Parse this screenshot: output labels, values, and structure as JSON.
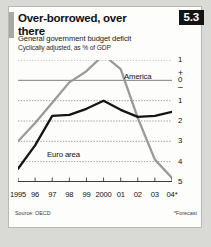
{
  "header": {
    "title": "Over-borrowed, over there",
    "badge": "5.3",
    "subtitle1": "General government budget deficit",
    "subtitle2": "Cyclically adjusted, as % of GDP"
  },
  "footer": {
    "source": "Source: OECD",
    "forecast_note": "*Forecast"
  },
  "labels": {
    "america": "America",
    "euro": "Euro area"
  },
  "colors": {
    "america": "#9a9a98",
    "euro": "#151515",
    "grid": "#8d8d8a",
    "zero_line": "#6f6f6d",
    "badge_bg": "#141414",
    "accent_bar": "#a9a9a4",
    "card_bg": "#fdfdfb",
    "page_bg": "#d9d9d5"
  },
  "chart_data": {
    "type": "line",
    "title": "Over-borrowed, over there",
    "subtitle": "General government budget deficit",
    "units": "Cyclically adjusted, as % of GDP",
    "xlabel": "",
    "ylabel": "% of GDP",
    "x": [
      1995,
      1996,
      1997,
      1998,
      1999,
      2000,
      2001,
      2002,
      2003,
      2004
    ],
    "xticklabels": [
      "1995",
      "96",
      "97",
      "98",
      "99",
      "2000",
      "01",
      "02",
      "03",
      "04*"
    ],
    "ylim": [
      -5,
      1
    ],
    "yticks": [
      1,
      0,
      -1,
      -2,
      -3,
      -4,
      -5
    ],
    "yticklabels": [
      "1",
      "0",
      "1",
      "2",
      "3",
      "4",
      "5"
    ],
    "ysign_plus": "+",
    "ysign_minus": "–",
    "grid": true,
    "gridlines": [
      1,
      -1,
      -2,
      -3,
      -4
    ],
    "zero_line": 0,
    "legend": "inline-labels",
    "annotations": [
      {
        "text": "America",
        "x": 2001.6,
        "y": 0.45
      },
      {
        "text": "Euro area",
        "x": 1996.5,
        "y": -3.45
      }
    ],
    "series": [
      {
        "name": "America",
        "color": "#9a9a98",
        "values": [
          -3.0,
          -2.1,
          -1.1,
          -0.1,
          0.45,
          1.25,
          0.55,
          -1.85,
          -3.9,
          -4.8
        ]
      },
      {
        "name": "Euro area",
        "color": "#151515",
        "values": [
          -4.35,
          -3.2,
          -1.75,
          -1.7,
          -1.4,
          -1.0,
          -1.45,
          -1.8,
          -1.75,
          -1.55
        ]
      }
    ],
    "forecast_from": 2004
  }
}
